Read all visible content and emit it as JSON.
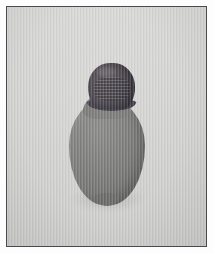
{
  "image": {
    "kind": "photograph",
    "subject_name": "bottle-with-stopper",
    "caption": "",
    "background_color": "#d3d3d2",
    "frame_color": "#4a4a4c",
    "paper_margin_color": "#fdfdfd",
    "width_px": 214,
    "height_px": 253
  },
  "frame": {
    "has_border": true,
    "border_width_px": 1.5,
    "inset_px": 6
  },
  "object": {
    "label": "bottle",
    "body": {
      "label": "vessel-body",
      "shape": "ovoid",
      "color": "#737372",
      "highlight_color": "#7f7f7e",
      "shade_color": "#636362"
    },
    "cap": {
      "label": "stopper-cap",
      "shape": "ridged-dome",
      "color": "#3a3540",
      "highlight_color": "#4e474e",
      "shade_color": "#2e2a34",
      "texture": "horizontal-ridges"
    },
    "shadow": {
      "label": "contact-shadow",
      "color": "rgba(0,0,0,0.13)"
    }
  },
  "texture": {
    "scanlines": "vertical",
    "vignette": true
  }
}
